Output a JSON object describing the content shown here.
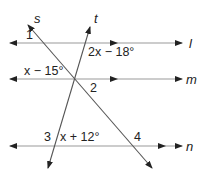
{
  "diagram": {
    "type": "parallel-lines-transversals",
    "colors": {
      "parallel_lines": "#9a9a9a",
      "transversals": "#555555",
      "text": "#222222",
      "background": "#ffffff"
    },
    "parallel_lines": [
      {
        "name": "l",
        "label": "l",
        "y": 43
      },
      {
        "name": "m",
        "label": "m",
        "y": 79
      },
      {
        "name": "n",
        "label": "n",
        "y": 146
      }
    ],
    "transversals": [
      {
        "name": "s",
        "label": "s"
      },
      {
        "name": "t",
        "label": "t"
      }
    ],
    "angle_labels": {
      "angle1": "1",
      "angle2": "2",
      "angle3": "3",
      "angle4": "4",
      "expr_top": "2x − 18°",
      "expr_mid": "x − 15°",
      "expr_bottom": "x + 12°"
    }
  }
}
